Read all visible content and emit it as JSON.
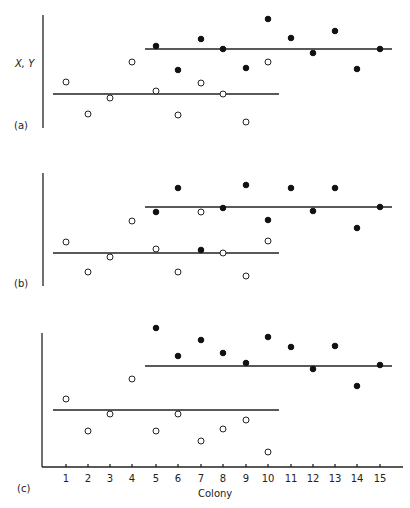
{
  "chart_data": {
    "type": "scatter",
    "title": "",
    "xlabel": "Colony",
    "ylabel": "X, Y",
    "x_categories": [
      1,
      2,
      3,
      4,
      5,
      6,
      7,
      8,
      9,
      10,
      11,
      12,
      13,
      14,
      15
    ],
    "tick_labels": [
      "1",
      "2",
      "3",
      "4",
      "5",
      "6",
      "7",
      "8",
      "9",
      "10",
      "11",
      "12",
      "13",
      "14",
      "15"
    ],
    "legend": [],
    "panels": [
      {
        "label": "(a)",
        "series": [
          {
            "name": "X (open)",
            "x": [
              1,
              2,
              3,
              4,
              5,
              6,
              7,
              8,
              9,
              10
            ],
            "values": [
              41,
              13,
              27,
              59,
              33,
              12,
              40,
              30,
              5,
              59
            ]
          },
          {
            "name": "Y (filled)",
            "x": [
              5,
              6,
              7,
              8,
              9,
              10,
              11,
              12,
              13,
              14,
              15
            ],
            "values": [
              72,
              51,
              78,
              70,
              53,
              96,
              79,
              66,
              86,
              52,
              70
            ]
          }
        ],
        "mean_lines": [
          {
            "name": "X mean",
            "x_range": [
              0.5,
              10.5
            ],
            "value": 30
          },
          {
            "name": "Y mean",
            "x_range": [
              4.6,
              15.5
            ],
            "value": 70
          }
        ]
      },
      {
        "label": "(b)",
        "series": [
          {
            "name": "X (open)",
            "x": [
              1,
              2,
              3,
              4,
              5,
              6,
              7,
              8,
              9,
              10
            ],
            "values": [
              38,
              11,
              25,
              57,
              42,
              11,
              68,
              33,
              7,
              39
            ]
          },
          {
            "name": "Y (filled)",
            "x": [
              5,
              6,
              7,
              8,
              9,
              10,
              11,
              12,
              13,
              14,
              15
            ],
            "values": [
              68,
              89,
              36,
              71,
              92,
              58,
              89,
              68,
              89,
              50,
              72
            ]
          }
        ],
        "mean_lines": [
          {
            "name": "X mean",
            "x_range": [
              0.5,
              10.5
            ],
            "value": 33
          },
          {
            "name": "Y mean",
            "x_range": [
              4.6,
              15.5
            ],
            "value": 72
          }
        ]
      },
      {
        "label": "(c)",
        "series": [
          {
            "name": "X (open)",
            "x": [
              1,
              2,
              3,
              4,
              5,
              6,
              7,
              8,
              9,
              10
            ],
            "values": [
              50,
              27,
              39,
              65,
              27,
              39,
              19,
              28,
              35,
              11
            ]
          },
          {
            "name": "Y (filled)",
            "x": [
              5,
              6,
              7,
              8,
              9,
              10,
              11,
              12,
              13,
              14,
              15
            ],
            "values": [
              103,
              83,
              95,
              85,
              78,
              97,
              90,
              73,
              90,
              60,
              75
            ]
          }
        ],
        "mean_lines": [
          {
            "name": "X mean",
            "x_range": [
              0.5,
              10.5
            ],
            "value": 42
          },
          {
            "name": "Y mean",
            "x_range": [
              4.6,
              15.5
            ],
            "value": 75
          }
        ]
      }
    ]
  },
  "labels": {
    "y_axis": "X, Y",
    "x_axis": "Colony",
    "panel_a": "(a)",
    "panel_b": "(b)",
    "panel_c": "(c)"
  },
  "layout_px": {
    "tick_x": [
      66,
      88,
      110,
      132,
      156,
      178,
      201,
      223,
      246,
      268,
      291,
      313,
      335,
      357,
      380
    ],
    "panels": [
      {
        "top": 15,
        "bottom": 130,
        "open_y": [
          82,
          114,
          98,
          62,
          91,
          115,
          83,
          94,
          122,
          62
        ],
        "filled_y": [
          46,
          70,
          39,
          49,
          68,
          19,
          38,
          53,
          31,
          69,
          49
        ],
        "lower_line_y": 94,
        "upper_line_y": 49
      },
      {
        "top": 173,
        "bottom": 290,
        "open_y": [
          242,
          272,
          257,
          221,
          249,
          272,
          212,
          253,
          276,
          241
        ],
        "filled_y": [
          212,
          188,
          250,
          208,
          185,
          220,
          188,
          211,
          188,
          228,
          207
        ],
        "lower_line_y": 253,
        "upper_line_y": 207
      },
      {
        "top": 333,
        "bottom": 467,
        "open_y": [
          399,
          431,
          414,
          379,
          431,
          414,
          441,
          429,
          420,
          452
        ],
        "filled_y": [
          328,
          356,
          340,
          353,
          363,
          337,
          347,
          369,
          346,
          386,
          365
        ],
        "lower_line_y": 410,
        "upper_line_y": 366
      }
    ]
  }
}
